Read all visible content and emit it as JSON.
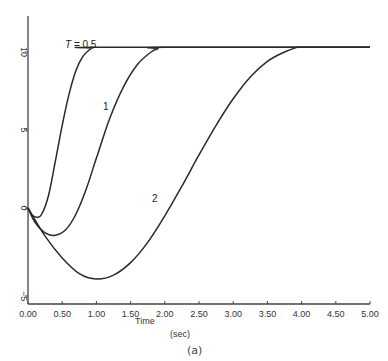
{
  "chart_data": {
    "type": "line",
    "title": "",
    "caption": "(a)",
    "xlabel": "Time",
    "xlabel_unit": "(sec)",
    "ylabel": "",
    "xlim": [
      0,
      5
    ],
    "ylim": [
      -5,
      10
    ],
    "grid": false,
    "x_ticks": [
      "0.00",
      "0.50",
      "1.00",
      "1.50",
      "2.00",
      "2.50",
      "3.00",
      "3.50",
      "4.00",
      "4.50",
      "5.00"
    ],
    "y_ticks": [
      "−5",
      "0",
      "5",
      "10"
    ],
    "series": [
      {
        "name": "T = 0.5",
        "label": "T = 0.5",
        "x": [
          0,
          0.05,
          0.125,
          0.2,
          0.3,
          0.4,
          0.5,
          0.6,
          0.7,
          0.8,
          0.9,
          0.95,
          1.0,
          5.0
        ],
        "y": [
          0,
          -0.4,
          -0.6,
          -0.4,
          0.8,
          3.0,
          5.3,
          7.3,
          8.8,
          9.7,
          10.15,
          10.25,
          10.3,
          10.3
        ]
      },
      {
        "name": "T = 1",
        "label": "1",
        "x": [
          0,
          0.1,
          0.25,
          0.4,
          0.55,
          0.7,
          0.85,
          1.0,
          1.2,
          1.4,
          1.6,
          1.8,
          1.9,
          2.0,
          5.0
        ],
        "y": [
          0,
          -0.9,
          -1.6,
          -1.75,
          -1.4,
          -0.4,
          1.2,
          3.2,
          5.8,
          7.8,
          9.2,
          10.0,
          10.2,
          10.3,
          10.3
        ]
      },
      {
        "name": "T = 2",
        "label": "2",
        "x": [
          0,
          0.25,
          0.5,
          0.75,
          1.0,
          1.25,
          1.5,
          1.75,
          2.0,
          2.25,
          2.5,
          2.75,
          3.0,
          3.25,
          3.5,
          3.75,
          3.9,
          4.0,
          5.0
        ],
        "y": [
          0,
          -1.8,
          -3.2,
          -4.2,
          -4.55,
          -4.3,
          -3.5,
          -2.2,
          -0.5,
          1.4,
          3.4,
          5.3,
          7.0,
          8.4,
          9.4,
          10.0,
          10.25,
          10.3,
          10.3
        ]
      }
    ],
    "annotations": [
      {
        "text": "T = 0.5",
        "x": 0.65,
        "y": 10.8
      },
      {
        "text": "1",
        "x": 1.12,
        "y": 6.8
      },
      {
        "text": "2",
        "x": 1.85,
        "y": 2.0
      }
    ]
  },
  "labels": {
    "x_title": "Time",
    "x_unit": "(sec)",
    "caption": "(a)",
    "curve_t05": "T = 0.5",
    "curve_1": "1",
    "curve_2": "2"
  },
  "style": {
    "line_color": "#2a2a2a",
    "axis_color": "#444444"
  }
}
